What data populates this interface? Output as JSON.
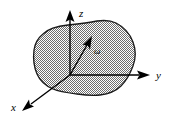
{
  "figure": {
    "background_color": "#ffffff",
    "body": {
      "name": "rigid-body",
      "fill_color": "#a8a8a8",
      "fill_pattern": "stipple",
      "outline_color": "#1a1a1a"
    },
    "axes": [
      {
        "id": "x",
        "label": "x",
        "direction": "lower-left",
        "label_x": 12,
        "label_y": 111,
        "line": {
          "x1": 70,
          "y1": 75,
          "x2": 22,
          "y2": 110
        },
        "color": "#000000"
      },
      {
        "id": "y",
        "label": "y",
        "direction": "right",
        "label_x": 156,
        "label_y": 79,
        "line": {
          "x1": 70,
          "y1": 75,
          "x2": 145,
          "y2": 75
        },
        "color": "#000000"
      },
      {
        "id": "z",
        "label": "z",
        "direction": "up",
        "label_x": 79,
        "label_y": 14,
        "line": {
          "x1": 70,
          "y1": 75,
          "x2": 70,
          "y2": 12
        },
        "color": "#000000"
      }
    ],
    "vectors": [
      {
        "id": "omega",
        "label": "ω",
        "label_x": 95,
        "label_y": 53,
        "line": {
          "x1": 70,
          "y1": 75,
          "x2": 90,
          "y2": 40
        },
        "color": "#000000",
        "description": "angular velocity vector from origin"
      }
    ],
    "origin": {
      "x": 70,
      "y": 75,
      "label": ""
    }
  }
}
